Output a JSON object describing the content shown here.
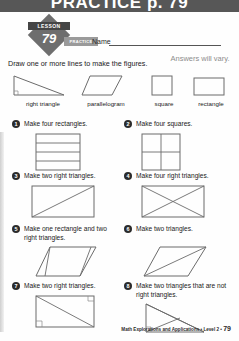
{
  "banner": {
    "title": "PRACTICE p. 79"
  },
  "badge": {
    "lesson_label": "LESSON",
    "lesson_number": "79",
    "practice_label": "PRACTICE"
  },
  "name_field": {
    "label": "Name",
    "value": ""
  },
  "instruction": "Draw one or more lines to make the figures.",
  "answers_note": "Answers will vary.",
  "examples": [
    {
      "label": "right triangle",
      "shape": "right-triangle"
    },
    {
      "label": "parallelogram",
      "shape": "parallelogram"
    },
    {
      "label": "square",
      "shape": "square"
    },
    {
      "label": "rectangle",
      "shape": "rectangle"
    }
  ],
  "problems": [
    {
      "number": "1",
      "text": "Make four rectangles.",
      "figure": "rectangle-split-4-horizontal"
    },
    {
      "number": "2",
      "text": "Make four squares.",
      "figure": "square-split-quadrants"
    },
    {
      "number": "3",
      "text": "Make two right triangles.",
      "figure": "rectangle-one-diagonal"
    },
    {
      "number": "4",
      "text": "Make four right triangles.",
      "figure": "rectangle-both-diagonals"
    },
    {
      "number": "5",
      "text": "Make one rectangle and two right triangles.",
      "figure": "parallelogram-two-verticals"
    },
    {
      "number": "6",
      "text": "Make two triangles.",
      "figure": "parallelogram-one-diagonal"
    },
    {
      "number": "7",
      "text": "Make two right triangles.",
      "figure": "rectangle-diagonal-with-marks"
    },
    {
      "number": "8",
      "text": "Make two triangles that are not right triangles.",
      "figure": "right-triangle-interior-line"
    }
  ],
  "footer": {
    "source": "Math Explorations and Applications • Level 2 •",
    "page": "79"
  }
}
